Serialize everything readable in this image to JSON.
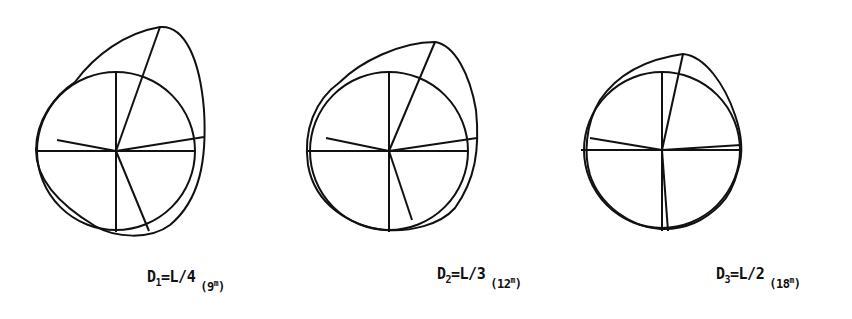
{
  "figure": {
    "stroke_color": "#111111",
    "background": "#ffffff",
    "panels": [
      {
        "id": "d1",
        "label_main": "D",
        "label_sub": "1",
        "label_eq": "=L/4",
        "label_paren_open": "(",
        "label_value": "9",
        "label_unit": "m",
        "label_paren_close": ")"
      },
      {
        "id": "d2",
        "label_main": "D",
        "label_sub": "2",
        "label_eq": "=L/3",
        "label_paren_open": "(",
        "label_value": "12",
        "label_unit": "m",
        "label_paren_close": ")"
      },
      {
        "id": "d3",
        "label_main": "D",
        "label_sub": "3",
        "label_eq": "=L/2",
        "label_paren_open": "(",
        "label_value": "18",
        "label_unit": "m",
        "label_paren_close": ")"
      }
    ]
  }
}
